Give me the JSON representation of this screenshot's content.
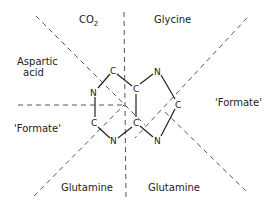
{
  "diagram": {
    "sources": {
      "co2": {
        "text": "CO",
        "sub": "2"
      },
      "glycine": "Glycine",
      "aspartic_line1": "Aspartic",
      "aspartic_line2": "acid",
      "formate_left": "'Formate'",
      "formate_right": "'Formate'",
      "glutamine_left": "Glutamine",
      "glutamine_right": "Glutamine"
    },
    "atoms": {
      "c6": "C",
      "n1": "N",
      "c2": "C",
      "n3": "N",
      "c5": "C",
      "c4": "C",
      "n7": "N",
      "n9": "N",
      "c8": "C"
    }
  }
}
